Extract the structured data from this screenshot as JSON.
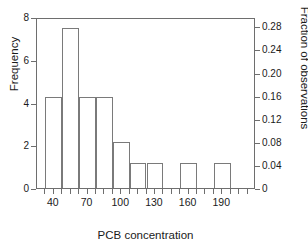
{
  "chart_data": {
    "type": "bar",
    "title": "",
    "subtitle": "",
    "xlabel": "PCB concentration",
    "ylabel": "Frequency",
    "y2label": "Fraction of observations",
    "grid": false,
    "legend": "none",
    "xlim": [
      25,
      220
    ],
    "ylim": [
      0,
      8
    ],
    "y2lim": [
      0,
      0.2963
    ],
    "bin_width": 15,
    "x_ticks": [
      40,
      70,
      100,
      130,
      160,
      190
    ],
    "x_tick_labels": [
      "40",
      "70",
      "100",
      "130",
      "160",
      "190"
    ],
    "x_minor_ticks": [
      32.5,
      47.5,
      55,
      62.5,
      77.5,
      85,
      92.5,
      107.5,
      115,
      122.5,
      137.5,
      145,
      152.5,
      167.5,
      175,
      182.5,
      197.5,
      205,
      212.5
    ],
    "y_ticks": [
      0,
      2,
      4,
      6,
      8
    ],
    "y_tick_labels": [
      "0",
      "2",
      "4",
      "6",
      "8"
    ],
    "y2_ticks": [
      0,
      0.04,
      0.08,
      0.12,
      0.16,
      0.2,
      0.24,
      0.28
    ],
    "y2_tick_labels": [
      "0",
      "0.04",
      "0.08",
      "0.12",
      "0.16",
      "0.20",
      "0.24",
      "0.28"
    ],
    "bars": [
      {
        "bin_start": 32.5,
        "bin_end": 47.5,
        "center": 40,
        "frequency": 4.25,
        "fraction": 0.1574
      },
      {
        "bin_start": 47.5,
        "bin_end": 62.5,
        "center": 55,
        "frequency": 7.5,
        "fraction": 0.2778
      },
      {
        "bin_start": 62.5,
        "bin_end": 77.5,
        "center": 70,
        "frequency": 4.25,
        "fraction": 0.1574
      },
      {
        "bin_start": 77.5,
        "bin_end": 92.5,
        "center": 85,
        "frequency": 4.25,
        "fraction": 0.1574
      },
      {
        "bin_start": 92.5,
        "bin_end": 107.5,
        "center": 100,
        "frequency": 2.17,
        "fraction": 0.0803
      },
      {
        "bin_start": 107.5,
        "bin_end": 122.5,
        "center": 115,
        "frequency": 1.17,
        "fraction": 0.0432
      },
      {
        "bin_start": 122.5,
        "bin_end": 137.5,
        "center": 130,
        "frequency": 1.17,
        "fraction": 0.0432
      },
      {
        "bin_start": 137.5,
        "bin_end": 152.5,
        "center": 145,
        "frequency": 0,
        "fraction": 0
      },
      {
        "bin_start": 152.5,
        "bin_end": 167.5,
        "center": 160,
        "frequency": 1.17,
        "fraction": 0.0432
      },
      {
        "bin_start": 167.5,
        "bin_end": 182.5,
        "center": 175,
        "frequency": 0,
        "fraction": 0
      },
      {
        "bin_start": 182.5,
        "bin_end": 197.5,
        "center": 190,
        "frequency": 1.17,
        "fraction": 0.0432
      }
    ],
    "colors": {
      "bar_fill": "#ffffff",
      "bar_edge": "#7a7a7a",
      "axis": "#6e6e6e",
      "text": "#1a1a1a",
      "background": "#ffffff"
    }
  }
}
